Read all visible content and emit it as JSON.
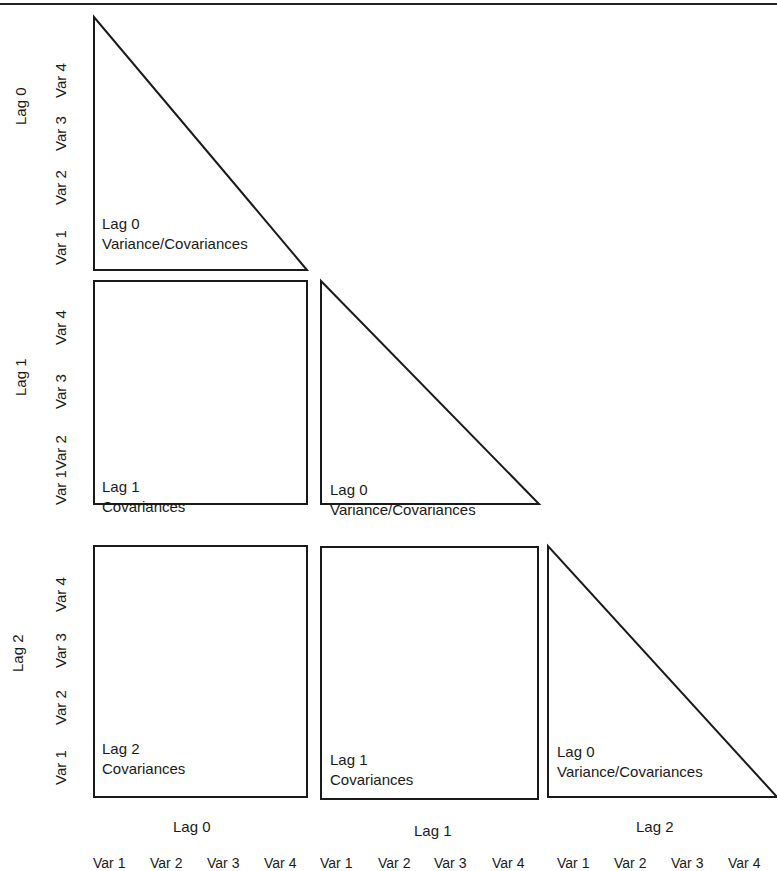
{
  "diagram": {
    "row_groups": [
      {
        "label": "Lag 0",
        "vars": [
          "Var 1",
          "Var 2",
          "Var 3",
          "Var 4"
        ]
      },
      {
        "label": "Lag 1",
        "vars": [
          "Var 1",
          "Var 2",
          "Var 3",
          "Var 4"
        ]
      },
      {
        "label": "Lag 2",
        "vars": [
          "Var 1",
          "Var 2",
          "Var 3",
          "Var 4"
        ]
      }
    ],
    "col_groups": [
      {
        "label": "Lag 0",
        "vars": [
          "Var 1",
          "Var 2",
          "Var 3",
          "Var 4"
        ]
      },
      {
        "label": "Lag 1",
        "vars": [
          "Var 1",
          "Var 2",
          "Var 3",
          "Var 4"
        ]
      },
      {
        "label": "Lag 2",
        "vars": [
          "Var 1",
          "Var 2",
          "Var 3",
          "Var 4"
        ]
      }
    ],
    "cells": [
      {
        "row": 0,
        "col": 0,
        "shape": "triangle",
        "line1": "Lag 0",
        "line2": "Variance/Covariances"
      },
      {
        "row": 1,
        "col": 0,
        "shape": "rectangle",
        "line1": "Lag 1",
        "line2": "Covariances"
      },
      {
        "row": 1,
        "col": 1,
        "shape": "triangle",
        "line1": "Lag 0",
        "line2": "Variance/Covariances"
      },
      {
        "row": 2,
        "col": 0,
        "shape": "rectangle",
        "line1": "Lag 2",
        "line2": "Covariances"
      },
      {
        "row": 2,
        "col": 1,
        "shape": "rectangle",
        "line1": "Lag 1",
        "line2": "Covariances"
      },
      {
        "row": 2,
        "col": 2,
        "shape": "triangle",
        "line1": "Lag 0",
        "line2": "Variance/Covariances"
      }
    ],
    "colors": {
      "stroke": "#1a1a1a",
      "background": "#ffffff",
      "text": "#1a1a1a"
    }
  }
}
